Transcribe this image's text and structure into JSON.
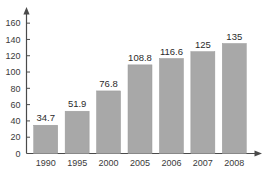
{
  "chart_data": {
    "type": "bar",
    "title": "",
    "subtitle": "",
    "xlabel": "",
    "ylabel": "",
    "categories": [
      "1990",
      "1995",
      "2000",
      "2005",
      "2006",
      "2007",
      "2008"
    ],
    "values": [
      34.7,
      51.9,
      76.8,
      108.8,
      116.6,
      125,
      135
    ],
    "value_labels": [
      "34.7",
      "51.9",
      "76.8",
      "108.8",
      "116.6",
      "125",
      "135"
    ],
    "ylim": [
      0,
      170
    ],
    "yticks": [
      0,
      20,
      40,
      60,
      80,
      100,
      120,
      140,
      160
    ],
    "ytick_labels": [
      "0",
      "20",
      "40",
      "60",
      "80",
      "100",
      "120",
      "140",
      "160"
    ],
    "grid": false,
    "legend": false,
    "legend_position": "none",
    "bar_color": "#a8a8a8",
    "axis_color": "#4a4a4a",
    "text_color": "#3a3a3a",
    "background_color": "#ffffff",
    "y_axis_arrow": true,
    "x_axis_arrow": true
  }
}
